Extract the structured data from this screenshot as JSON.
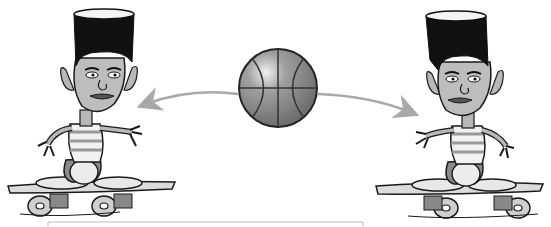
{
  "scene": {
    "description": "Two cartoon boys on skateboards passing a basketball between them",
    "colors": {
      "background": "#ffffff",
      "hair": "#111111",
      "skin": "#b8b8b8",
      "shirt_stripe": "#9a9a9a",
      "ball": "#8c8c8c",
      "arrow": "#a8a8a8",
      "board": "#dcdcdc",
      "outline": "#1a1a1a"
    },
    "figures": [
      {
        "name": "left-skater",
        "position": "left"
      },
      {
        "name": "right-skater",
        "position": "right"
      }
    ],
    "ball": {
      "label": "basketball"
    },
    "arrows": [
      {
        "name": "arrow-to-left",
        "direction": "left"
      },
      {
        "name": "arrow-to-right",
        "direction": "right"
      }
    ]
  }
}
